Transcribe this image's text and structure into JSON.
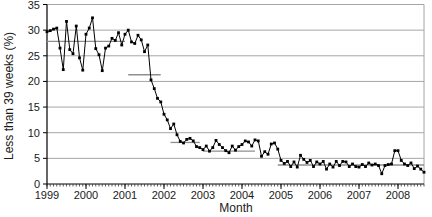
{
  "window": {
    "width": 432,
    "height": 217,
    "background": "#ffffff"
  },
  "chart_data": {
    "type": "line",
    "title": "",
    "xlabel": "Month",
    "ylabel": "Less than 39 weeks (%)",
    "x_start": "1999-01",
    "x_unit": "month",
    "ylim": [
      0,
      35
    ],
    "yticks": [
      0,
      5,
      10,
      15,
      20,
      25,
      30,
      35
    ],
    "xticks": [
      "1999",
      "2000",
      "2001",
      "2002",
      "2003",
      "2004",
      "2005",
      "2006",
      "2007",
      "2008"
    ],
    "months_per_major_tick": 12,
    "grid": "horizontal",
    "legend_position": "none",
    "line_color": "#000000",
    "marker": "square",
    "marker_color": "#000000",
    "grid_color": "#a6a6a6",
    "axis_color": "#000000",
    "center_line_color": "#8f8f8f",
    "values": [
      29.7,
      29.9,
      30.2,
      30.4,
      26.5,
      22.3,
      31.7,
      26.2,
      25.4,
      30.8,
      24.6,
      22.2,
      29.2,
      30.4,
      32.4,
      26.4,
      25.2,
      22.1,
      26.5,
      26.9,
      28.4,
      28.0,
      29.5,
      27.1,
      29.2,
      30.0,
      27.7,
      27.4,
      29.0,
      28.1,
      25.8,
      27.1,
      20.3,
      18.6,
      16.7,
      16.0,
      13.6,
      12.5,
      10.8,
      11.7,
      9.6,
      8.3,
      8.0,
      8.7,
      8.9,
      8.4,
      7.3,
      7.1,
      6.7,
      7.4,
      6.4,
      7.1,
      8.5,
      7.7,
      7.1,
      6.5,
      6.1,
      7.4,
      6.6,
      7.3,
      7.7,
      8.4,
      8.2,
      7.4,
      8.6,
      8.4,
      5.4,
      6.3,
      5.8,
      7.8,
      8.0,
      6.8,
      4.6,
      4.0,
      4.4,
      3.4,
      4.3,
      3.3,
      5.6,
      4.8,
      4.2,
      4.6,
      3.4,
      4.3,
      3.9,
      4.4,
      2.9,
      3.9,
      3.3,
      4.4,
      3.6,
      4.4,
      4.3,
      3.4,
      3.9,
      3.4,
      3.3,
      3.8,
      3.4,
      4.1,
      3.7,
      3.9,
      3.6,
      2.0,
      3.6,
      3.8,
      3.9,
      6.5,
      6.5,
      4.6,
      3.9,
      3.6,
      4.1,
      3.0,
      3.5,
      2.9,
      2.3
    ],
    "center_lines": [
      {
        "start_index": 0,
        "end_index": 24,
        "value": 27.8
      },
      {
        "start_index": 25,
        "end_index": 35,
        "value": 21.3
      },
      {
        "start_index": 38,
        "end_index": 47,
        "value": 8.1
      },
      {
        "start_index": 48,
        "end_index": 64,
        "value": 6.4
      },
      {
        "start_index": 71,
        "end_index": 116,
        "value": 3.7
      }
    ]
  }
}
